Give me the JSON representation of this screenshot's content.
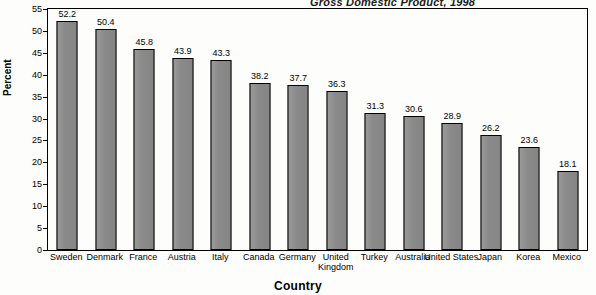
{
  "chart_data": {
    "type": "bar",
    "title": "Gross Domestic Product, 1998",
    "xlabel": "Country",
    "ylabel": "Percent",
    "categories": [
      "Sweden",
      "Denmark",
      "France",
      "Austria",
      "Italy",
      "Canada",
      "Germany",
      "United Kingdom",
      "Turkey",
      "Australia",
      "United States",
      "Japan",
      "Korea",
      "Mexico"
    ],
    "values": [
      52.2,
      50.4,
      45.8,
      43.9,
      43.3,
      38.2,
      37.7,
      36.3,
      31.3,
      30.6,
      28.9,
      26.2,
      23.6,
      18.1
    ],
    "value_labels": [
      "52.2",
      "50.4",
      "45.8",
      "43.9",
      "43.3",
      "38.2",
      "37.7",
      "36.3",
      "31.3",
      "30.6",
      "28.9",
      "26.2",
      "23.6",
      "18.1"
    ],
    "ylim": [
      0,
      55
    ],
    "ytick_values": [
      0,
      5,
      10,
      15,
      20,
      25,
      30,
      35,
      40,
      45,
      50,
      55
    ],
    "ytick_labels": [
      "0",
      "5",
      "10",
      "15",
      "20",
      "25",
      "30",
      "35",
      "40",
      "45",
      "50",
      "55"
    ],
    "grid": false,
    "legend": false,
    "bar_color": "#8c8c8c",
    "bar_border_color": "#000000"
  }
}
